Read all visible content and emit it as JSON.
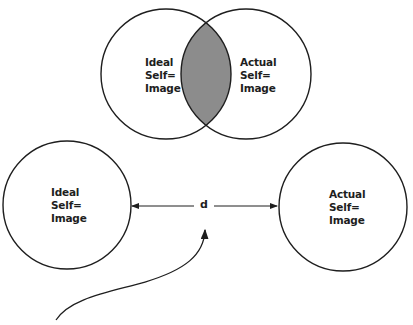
{
  "diagram": {
    "top_venn": {
      "left_circle": {
        "label_lines": [
          "Ideal",
          "Self=",
          "Image"
        ]
      },
      "right_circle": {
        "label_lines": [
          "Actual",
          "Self=",
          "Image"
        ]
      },
      "overlap_fill": "#8c8c8c"
    },
    "bottom_separated": {
      "left_circle": {
        "label_lines": [
          "Ideal",
          "Self=",
          "Image"
        ]
      },
      "right_circle": {
        "label_lines": [
          "Actual",
          "Self=",
          "Image"
        ]
      },
      "distance_label": "d"
    },
    "colors": {
      "stroke": "#1e1e1e",
      "background": "#ffffff"
    }
  }
}
